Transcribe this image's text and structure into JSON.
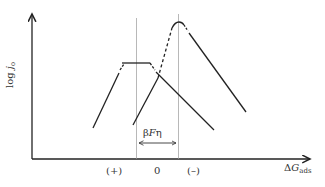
{
  "diagram": {
    "y_axis_label_prefix": "log ",
    "y_axis_label_var": "j",
    "y_axis_label_sub": "o",
    "x_axis_label_prefix": "Δ",
    "x_axis_label_var": "G",
    "x_axis_label_sub": "ads",
    "tick_labels": {
      "plus": "(+)",
      "zero": "0",
      "minus": "(–)"
    },
    "shift_label_beta": "β",
    "shift_label_F": "F",
    "shift_label_eta": "η",
    "curves": [
      {
        "name": "volcano-curve-1",
        "peak": "flat-top"
      },
      {
        "name": "volcano-curve-2",
        "peak": "rounded, shifted right"
      }
    ],
    "line_color": "#222222",
    "guide_color": "#888888"
  }
}
